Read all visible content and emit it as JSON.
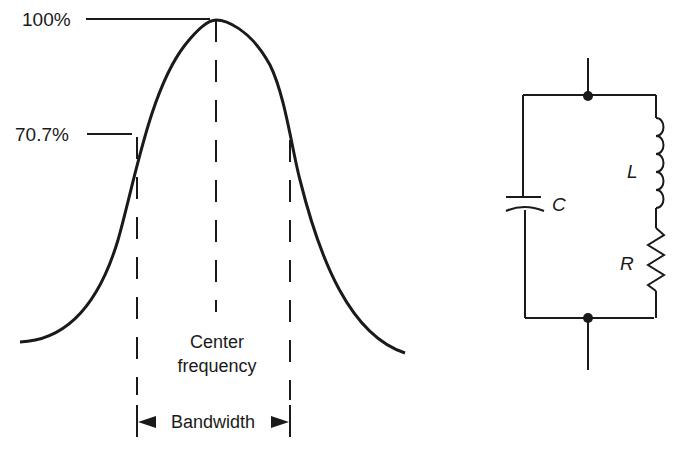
{
  "diagram": {
    "curve": {
      "type": "resonance-curve",
      "labels": {
        "peak": "100%",
        "half_power": "70.7%",
        "center": "Center",
        "center_line2": "frequency",
        "bandwidth": "Bandwidth"
      }
    },
    "circuit": {
      "type": "parallel-RLC",
      "components": {
        "capacitor": "C",
        "inductor": "L",
        "resistor": "R"
      }
    },
    "colors": {
      "ink": "#1a1a1a",
      "background": "#ffffff"
    }
  }
}
